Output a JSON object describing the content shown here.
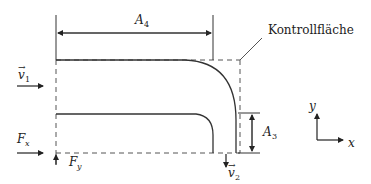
{
  "diagram": {
    "labels": {
      "control_surface": "Kontrollfläche",
      "area_top": "A",
      "area_top_sub": "4",
      "area_right": "A",
      "area_right_sub": "3",
      "velocity_in": "v",
      "velocity_in_sub": "1",
      "velocity_out": "v",
      "velocity_out_sub": "2",
      "force_x": "F",
      "force_x_sub": "x",
      "force_y": "F",
      "force_y_sub": "y",
      "axis_x": "x",
      "axis_y": "y",
      "vector_mark": "→"
    },
    "colors": {
      "line": "#333333",
      "dashed": "#555555",
      "text": "#222222"
    }
  }
}
